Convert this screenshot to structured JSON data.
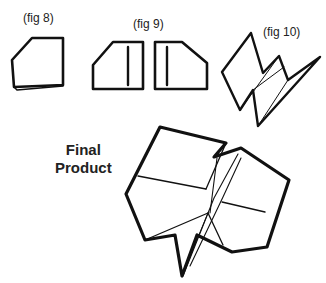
{
  "figures": {
    "fig8": {
      "label": "(fig 8)"
    },
    "fig9": {
      "label": "(fig 9)"
    },
    "fig10": {
      "label": "(fig 10)"
    }
  },
  "final": {
    "line1": "Final",
    "line2": "Product"
  },
  "colors": {
    "ink": "#111111",
    "background": "#ffffff"
  }
}
